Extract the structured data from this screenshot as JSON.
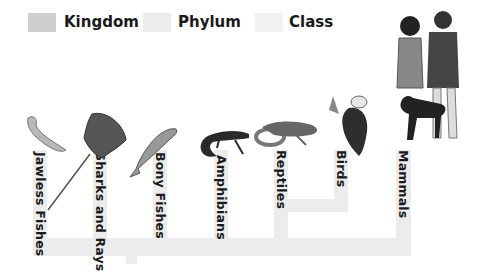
{
  "legend": {
    "items": [
      {
        "label": "Kingdom",
        "color": "#cfcfcf"
      },
      {
        "label": "Phylum",
        "color": "#ececec"
      },
      {
        "label": "Class",
        "color": "#f1f1f1"
      }
    ]
  },
  "tree": {
    "branch_color": "#ececec",
    "classes": [
      {
        "label": "Jawless Fishes",
        "icon": "lamprey-icon"
      },
      {
        "label": "Sharks and Rays",
        "icon": "stingray-icon"
      },
      {
        "label": "Bony Fishes",
        "icon": "trout-icon"
      },
      {
        "label": "Amphibians",
        "icon": "salamander-icon"
      },
      {
        "label": "Reptiles",
        "icon": "lizard-snake-icon"
      },
      {
        "label": "Birds",
        "icon": "eagle-icon"
      },
      {
        "label": "Mammals",
        "icon": "people-dog-icon"
      }
    ]
  }
}
